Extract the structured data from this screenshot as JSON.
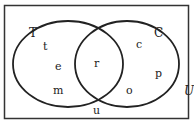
{
  "diagram": {
    "type": "venn",
    "universe_label": "U",
    "sets": [
      {
        "name": "T",
        "label": "T"
      },
      {
        "name": "C",
        "label": "C"
      }
    ],
    "regions": {
      "T_only": [
        "t",
        "e",
        "m"
      ],
      "T_and_C": [
        "r"
      ],
      "C_only": [
        "c",
        "p",
        "o"
      ],
      "outside": [
        "u"
      ]
    },
    "elements": [
      {
        "text": "t",
        "region": "T_only"
      },
      {
        "text": "e",
        "region": "T_only"
      },
      {
        "text": "m",
        "region": "T_only"
      },
      {
        "text": "r",
        "region": "T_and_C"
      },
      {
        "text": "c",
        "region": "C_only"
      },
      {
        "text": "p",
        "region": "C_only"
      },
      {
        "text": "o",
        "region": "C_only"
      },
      {
        "text": "u",
        "region": "outside"
      }
    ],
    "colors": {
      "stroke": "#222222",
      "background": "#ffffff"
    }
  }
}
